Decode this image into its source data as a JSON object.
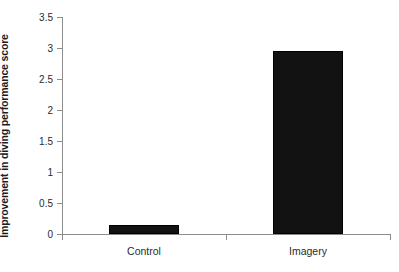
{
  "chart_data": {
    "type": "bar",
    "title": "",
    "subtitle": "",
    "xlabel": "",
    "ylabel": "Improvement in diving performance score",
    "categories": [
      "Control",
      "Imagery"
    ],
    "values": [
      0.15,
      2.95
    ],
    "series": [
      {
        "name": "Improvement in diving performance score",
        "values": [
          0.15,
          2.95
        ]
      }
    ],
    "ylim": [
      0,
      3.5
    ],
    "y_ticks": [
      0,
      0.5,
      1,
      1.5,
      2,
      2.5,
      3,
      3.5
    ],
    "y_tick_labels": [
      "0",
      "0.5",
      "1",
      "1.5",
      "2",
      "2.5",
      "3",
      "3.5"
    ],
    "grid": false,
    "legend": false,
    "legend_position": "none",
    "annotations": [],
    "bar_color": "#121212",
    "axis_color": "#8c8c8c",
    "background_color": "#ffffff"
  },
  "axes": {
    "y_title": "Improvement in diving performance score",
    "y_tick_labels": [
      "3.5",
      "3",
      "2.5",
      "2",
      "1.5",
      "1",
      "0.5",
      "0"
    ],
    "x_category_labels": [
      "Control",
      "Imagery"
    ]
  }
}
